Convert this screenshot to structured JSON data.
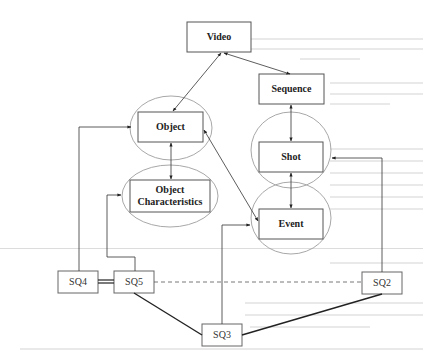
{
  "diagram": {
    "type": "relationship-diagram",
    "nodes": {
      "video": {
        "label": "Video"
      },
      "sequence": {
        "label": "Sequence"
      },
      "object": {
        "label": "Object"
      },
      "object_characteristics": {
        "label_line1": "Object",
        "label_line2": "Characteristics"
      },
      "shot": {
        "label": "Shot"
      },
      "event": {
        "label": "Event"
      }
    },
    "queries": {
      "sq2": {
        "label": "SQ2"
      },
      "sq3": {
        "label": "SQ3"
      },
      "sq4": {
        "label": "SQ4"
      },
      "sq5": {
        "label": "SQ5"
      }
    },
    "edges": [
      {
        "from": "video",
        "to": "object",
        "style": "bidirectional-arrow"
      },
      {
        "from": "video",
        "to": "sequence",
        "style": "bidirectional-arrow"
      },
      {
        "from": "sequence",
        "to": "shot",
        "style": "arrow"
      },
      {
        "from": "object",
        "to": "object_characteristics",
        "style": "bidirectional-arrow"
      },
      {
        "from": "shot",
        "to": "event",
        "style": "bidirectional-arrow"
      },
      {
        "from": "object",
        "to": "event",
        "style": "bidirectional-arrow"
      },
      {
        "from": "sq4",
        "to": "object",
        "style": "elbow-arrow"
      },
      {
        "from": "sq5",
        "to": "object_characteristics",
        "style": "elbow-arrow"
      },
      {
        "from": "sq3",
        "to": "event",
        "style": "elbow-arrow"
      },
      {
        "from": "sq2",
        "to": "shot",
        "style": "elbow-arrow"
      },
      {
        "from": "sq4",
        "to": "sq5",
        "style": "thick-double-line"
      },
      {
        "from": "sq5",
        "to": "sq2",
        "style": "dashed-line"
      },
      {
        "from": "sq5",
        "to": "sq3",
        "style": "thick-line"
      },
      {
        "from": "sq3",
        "to": "sq2",
        "style": "thick-line"
      }
    ],
    "colors": {
      "box_stroke": "#555555",
      "ellipse_stroke": "#a8a8a8",
      "line": "#333333",
      "background": "#ffffff"
    }
  }
}
